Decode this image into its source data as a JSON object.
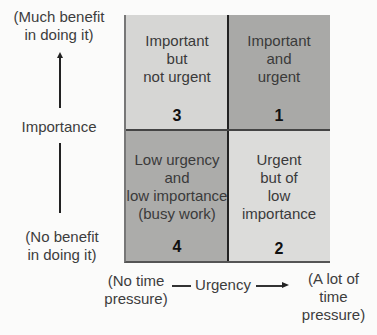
{
  "y_axis": {
    "top_label": [
      "(Much benefit",
      "in doing it)"
    ],
    "title": "Importance",
    "bottom_label": [
      "(No benefit",
      "in doing it)"
    ]
  },
  "x_axis": {
    "left_label": [
      "(No time",
      "pressure)"
    ],
    "title": "Urgency",
    "right_label": [
      "(A lot of",
      "time",
      "pressure)"
    ]
  },
  "quadrants": [
    {
      "position": "top-left",
      "lines": [
        "Important",
        "but",
        "not urgent"
      ],
      "number": "3",
      "color": "#d6d6d4"
    },
    {
      "position": "top-right",
      "lines": [
        "Important",
        "and",
        "urgent"
      ],
      "number": "1",
      "color": "#a9a9a7"
    },
    {
      "position": "bottom-left",
      "lines": [
        "Low urgency",
        "and",
        "low importance",
        "(busy work)"
      ],
      "number": "4",
      "color": "#acacaa"
    },
    {
      "position": "bottom-right",
      "lines": [
        "Urgent",
        "but of",
        "low",
        "importance"
      ],
      "number": "2",
      "color": "#dcdcda"
    }
  ]
}
